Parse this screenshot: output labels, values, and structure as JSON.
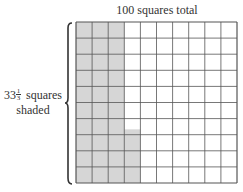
{
  "title": "100 squares total",
  "label": {
    "whole": "33",
    "numerator": "1",
    "denominator": "3",
    "line1_rest": " squares",
    "line2": "shaded"
  },
  "grid": {
    "rows": 10,
    "cols": 10,
    "full_shaded_columns": 3,
    "partial_column_shaded_cells": 3.333,
    "shade_color": "#d6d6d6",
    "line_color": "#555555"
  }
}
